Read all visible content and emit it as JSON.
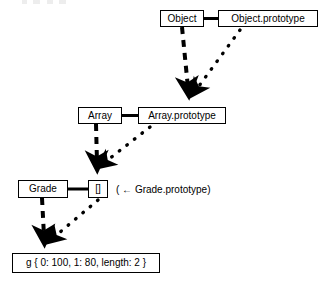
{
  "diagram": {
    "background_color": "#ffffff",
    "line_color": "#000000",
    "nodes": [
      {
        "id": "object",
        "label": "Object",
        "x": 160,
        "y": 10,
        "w": 44,
        "h": 17
      },
      {
        "id": "object_prototype",
        "label": "Object.prototype",
        "x": 218,
        "y": 10,
        "w": 100,
        "h": 17
      },
      {
        "id": "array",
        "label": "Array",
        "x": 78,
        "y": 107,
        "w": 44,
        "h": 17
      },
      {
        "id": "array_prototype",
        "label": "Array.prototype",
        "x": 138,
        "y": 107,
        "w": 88,
        "h": 17
      },
      {
        "id": "grade",
        "label": "Grade",
        "x": 18,
        "y": 180,
        "w": 50,
        "h": 18
      },
      {
        "id": "empty_array",
        "label": "[]",
        "x": 88,
        "y": 180,
        "w": 20,
        "h": 18
      },
      {
        "id": "instance",
        "label": "g { 0: 100, 1: 80, length: 2 }",
        "x": 12,
        "y": 253,
        "w": 148,
        "h": 20
      }
    ],
    "annotations": [
      {
        "id": "grade_prototype_note",
        "label": "( ← Grade.prototype)",
        "x": 116,
        "y": 185
      }
    ],
    "edges": [
      {
        "id": "object-to-object-prototype",
        "style": "solid",
        "from": "object",
        "to": "object_prototype",
        "arrow": false
      },
      {
        "id": "array-to-array-prototype",
        "style": "solid",
        "from": "array",
        "to": "array_prototype",
        "arrow": false
      },
      {
        "id": "grade-to-empty-array",
        "style": "solid",
        "from": "grade",
        "to": "empty_array",
        "arrow": false
      },
      {
        "id": "object-to-array-prototype",
        "style": "dashed",
        "from": "object",
        "to": "array_prototype",
        "arrow": true
      },
      {
        "id": "array-to-empty-array",
        "style": "dashed",
        "from": "array",
        "to": "empty_array",
        "arrow": true
      },
      {
        "id": "grade-to-instance",
        "style": "dashed",
        "from": "grade",
        "to": "instance",
        "arrow": true
      },
      {
        "id": "object-prototype-to-array-prototype",
        "style": "dotted",
        "from": "object_prototype",
        "to": "array_prototype",
        "arrow": true
      },
      {
        "id": "array-prototype-to-empty-array",
        "style": "dotted",
        "from": "array_prototype",
        "to": "empty_array",
        "arrow": true
      },
      {
        "id": "empty-array-to-instance",
        "style": "dotted",
        "from": "empty_array",
        "to": "instance",
        "arrow": true
      }
    ]
  }
}
